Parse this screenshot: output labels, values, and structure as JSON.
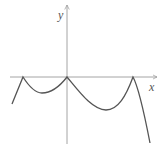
{
  "figure": {
    "type": "function graph sketch",
    "axes": {
      "x_label": "x",
      "y_label": "y",
      "x_axis_arrow": true,
      "y_axis_arrow": true
    },
    "curve": {
      "description": "Piecewise curve with cusps touching the x-axis at three points, dipping below between them",
      "cusps_on_x_axis": [
        "left of origin",
        "origin",
        "right of origin"
      ],
      "left_end": "descends below x-axis to the left",
      "right_end": "descends steeply below x-axis to the right"
    },
    "colors": {
      "axis": "#9a9a9a",
      "curve": "#555555",
      "background": "#ffffff"
    }
  }
}
